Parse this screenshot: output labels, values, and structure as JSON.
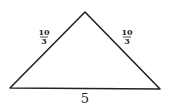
{
  "diagram": {
    "type": "isosceles-triangle",
    "vertices": {
      "top": [
        85,
        12
      ],
      "bottom_left": [
        10,
        88
      ],
      "bottom_right": [
        160,
        89
      ]
    },
    "left_side": {
      "numerator": "10",
      "denominator": "3"
    },
    "right_side": {
      "numerator": "10",
      "denominator": "3"
    },
    "base": {
      "label": "5"
    },
    "stroke_color": "#222222"
  }
}
